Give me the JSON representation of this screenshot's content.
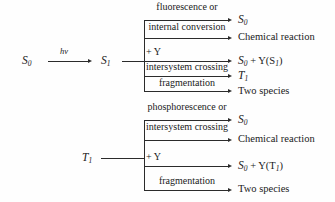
{
  "figure": {
    "line_color": "#2b2b2b",
    "background": "#fefefe"
  },
  "excitation": {
    "ground_state": "S",
    "ground_state_sub": "0",
    "photon_label": "hv",
    "excited_state": "S",
    "excited_state_sub": "1"
  },
  "singlet_block": {
    "source_state": "S",
    "source_state_sub": "1",
    "branches": [
      {
        "caption_line1": "fluorescence or",
        "caption_line2": "internal conversion",
        "product": "S",
        "product_sub": "0",
        "product_kind": "state"
      },
      {
        "caption_line1": "",
        "caption_line2": "",
        "product": "Chemical reaction",
        "product_sub": "",
        "product_kind": "text"
      },
      {
        "caption_line1": "",
        "caption_line2": "+ Y",
        "product": "S",
        "product_sub": "0",
        "product_suffix": " + Y(S",
        "product_suffix_sub": "1",
        "product_tail": ")",
        "product_kind": "quench"
      },
      {
        "caption_line1": "",
        "caption_line2": "intersystem crossing",
        "product": "T",
        "product_sub": "1",
        "product_kind": "state"
      },
      {
        "caption_line1": "",
        "caption_line2": "fragmentation",
        "product": "Two species",
        "product_sub": "",
        "product_kind": "text"
      }
    ]
  },
  "triplet_block": {
    "source_state": "T",
    "source_state_sub": "1",
    "branches": [
      {
        "caption_line1": "phosphorescence or",
        "caption_line2": "intersystem crossing",
        "product": "S",
        "product_sub": "0",
        "product_kind": "state"
      },
      {
        "caption_line1": "",
        "caption_line2": "",
        "product": "Chemical reaction",
        "product_sub": "",
        "product_kind": "text"
      },
      {
        "caption_line1": "",
        "caption_line2": "+ Y",
        "product": "S",
        "product_sub": "0",
        "product_suffix": " + Y(T",
        "product_suffix_sub": "1",
        "product_tail": ")",
        "product_kind": "quench"
      },
      {
        "caption_line1": "",
        "caption_line2": "fragmentation",
        "product": "Two species",
        "product_sub": "",
        "product_kind": "text"
      }
    ]
  }
}
